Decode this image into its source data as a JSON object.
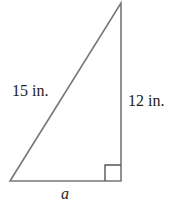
{
  "diagram": {
    "type": "right-triangle",
    "hypotenuse_label": "15 in.",
    "vertical_leg_label": "12 in.",
    "horizontal_leg_label": "a",
    "right_angle_marker": true,
    "stroke_color": "#777777",
    "text_color": "#222222"
  }
}
